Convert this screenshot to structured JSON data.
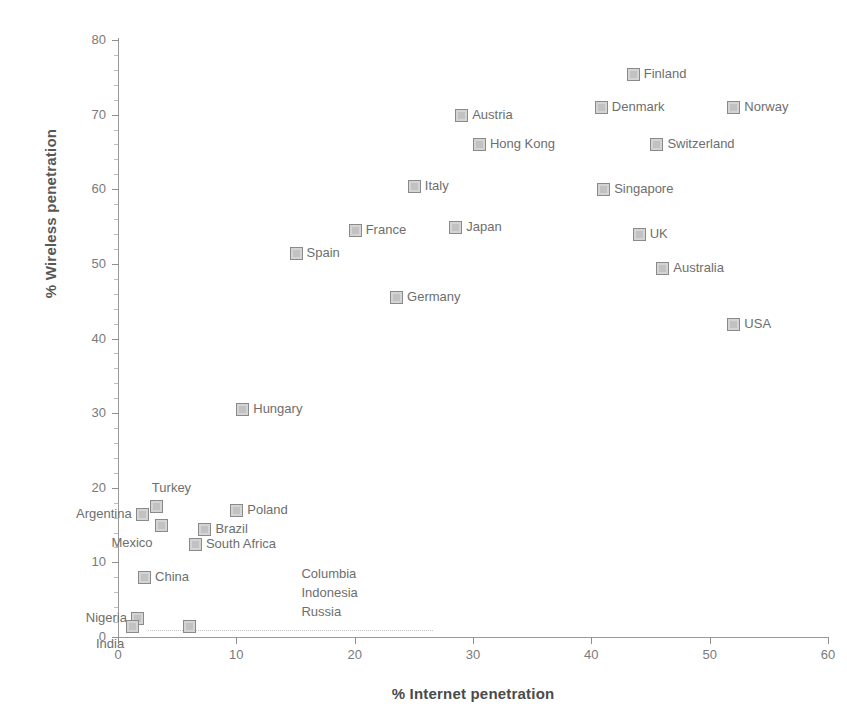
{
  "chart_data": {
    "type": "scatter",
    "title": "",
    "xlabel": "% Internet penetration",
    "ylabel": "% Wireless penetration",
    "xlim": [
      0,
      60
    ],
    "ylim": [
      0,
      80
    ],
    "xticks": [
      0,
      10,
      20,
      30,
      40,
      50,
      60
    ],
    "yticks": [
      0,
      10,
      20,
      30,
      40,
      50,
      60,
      70,
      80
    ],
    "grid": false,
    "legend": null,
    "points": [
      {
        "label": "Finland",
        "x": 43.5,
        "y": 75.5,
        "label_side": "right"
      },
      {
        "label": "Denmark",
        "x": 40.8,
        "y": 71.0,
        "label_side": "right"
      },
      {
        "label": "Norway",
        "x": 52.0,
        "y": 71.0,
        "label_side": "right"
      },
      {
        "label": "Austria",
        "x": 29.0,
        "y": 70.0,
        "label_side": "right"
      },
      {
        "label": "Hong Kong",
        "x": 30.5,
        "y": 66.0,
        "label_side": "right"
      },
      {
        "label": "Switzerland",
        "x": 45.5,
        "y": 66.0,
        "label_side": "right"
      },
      {
        "label": "Italy",
        "x": 25.0,
        "y": 60.5,
        "label_side": "right"
      },
      {
        "label": "Singapore",
        "x": 41.0,
        "y": 60.0,
        "label_side": "right"
      },
      {
        "label": "France",
        "x": 20.0,
        "y": 54.5,
        "label_side": "right"
      },
      {
        "label": "Japan",
        "x": 28.5,
        "y": 55.0,
        "label_side": "right"
      },
      {
        "label": "UK",
        "x": 44.0,
        "y": 54.0,
        "label_side": "right"
      },
      {
        "label": "Spain",
        "x": 15.0,
        "y": 51.5,
        "label_side": "right"
      },
      {
        "label": "Australia",
        "x": 46.0,
        "y": 49.5,
        "label_side": "right"
      },
      {
        "label": "Germany",
        "x": 23.5,
        "y": 45.5,
        "label_side": "right"
      },
      {
        "label": "USA",
        "x": 52.0,
        "y": 42.0,
        "label_side": "right"
      },
      {
        "label": "Hungary",
        "x": 10.5,
        "y": 30.5,
        "label_side": "right"
      },
      {
        "label": "Turkey",
        "x": 3.2,
        "y": 17.5,
        "label_side": "top"
      },
      {
        "label": "Argentina",
        "x": 2.0,
        "y": 16.5,
        "label_side": "left"
      },
      {
        "label": "Poland",
        "x": 10.0,
        "y": 17.0,
        "label_side": "right"
      },
      {
        "label": "Mexico",
        "x": 3.6,
        "y": 15.0,
        "label_side": "bottom"
      },
      {
        "label": "Brazil",
        "x": 7.3,
        "y": 14.5,
        "label_side": "right"
      },
      {
        "label": "South Africa",
        "x": 6.5,
        "y": 12.5,
        "label_side": "right"
      },
      {
        "label": "China",
        "x": 2.2,
        "y": 8.0,
        "label_side": "right"
      },
      {
        "label": "Nigeria",
        "x": 1.6,
        "y": 2.5,
        "label_side": "left"
      },
      {
        "label": "India",
        "x": 1.2,
        "y": 1.5,
        "label_side": "bottom"
      },
      {
        "label": "",
        "x": 6.0,
        "y": 1.5,
        "label_side": "none"
      }
    ],
    "text_annotations": [
      {
        "lines": [
          "Columbia",
          "Indonesia",
          "Russia"
        ],
        "x": 15.5,
        "y": 8.5
      }
    ]
  },
  "axis": {
    "x_tick_labels": [
      "0",
      "10",
      "20",
      "30",
      "40",
      "50",
      "60"
    ],
    "y_tick_labels": [
      "0",
      "10",
      "20",
      "30",
      "40",
      "50",
      "60",
      "70",
      "80"
    ]
  }
}
